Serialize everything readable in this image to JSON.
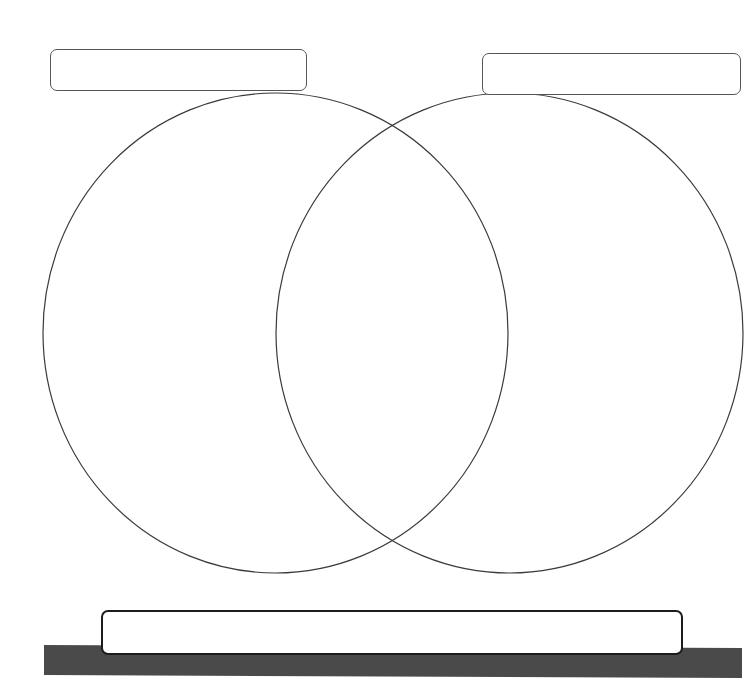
{
  "diagram": {
    "type": "venn",
    "set_count": 2,
    "sets": [
      {
        "id": "left",
        "label": "",
        "center": [
          275.5,
          333
        ],
        "radius": [
          232.5,
          240
        ]
      },
      {
        "id": "right",
        "label": "",
        "center": [
          509.5,
          333
        ],
        "radius": [
          233.5,
          240
        ]
      }
    ],
    "left_label_box": {
      "text": ""
    },
    "right_label_box": {
      "text": ""
    },
    "bottom_box": {
      "text": ""
    },
    "regions": {
      "left_only": "",
      "overlap": "",
      "right_only": ""
    },
    "colors": {
      "background": "#ffffff",
      "circle_stroke": "#3a3a3a",
      "box_stroke": "#555555",
      "bottom_box_stroke": "#1c1c1c",
      "base_bar": "#4a4a4a"
    }
  }
}
